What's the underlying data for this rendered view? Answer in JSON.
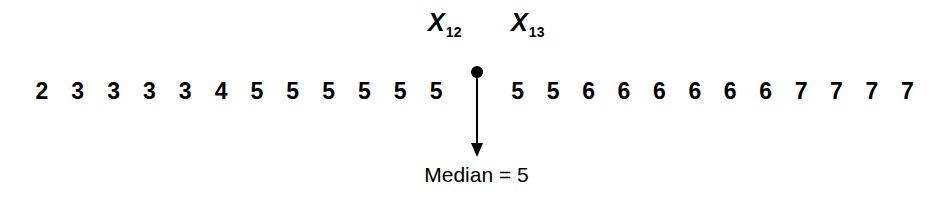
{
  "figure": {
    "background_color": "#ffffff",
    "ink_color": "#000000"
  },
  "labels": {
    "x12": {
      "symbol": "X",
      "subscript": "12",
      "full": "X12"
    },
    "x13": {
      "symbol": "X",
      "subscript": "13",
      "full": "X13"
    }
  },
  "median_pointer": {
    "caption": "Median = 5",
    "marker_name": "median-position-dot"
  },
  "chart_data": {
    "type": "table",
    "title": "",
    "subtitle": "",
    "xlabel": "",
    "ylabel": "",
    "n": 24,
    "ordered_values": [
      2,
      3,
      3,
      3,
      3,
      4,
      5,
      5,
      5,
      5,
      5,
      5,
      5,
      5,
      6,
      6,
      6,
      6,
      6,
      6,
      7,
      7,
      7,
      7
    ],
    "left_group": {
      "label": "values below the median position",
      "count": 12,
      "values": [
        2,
        3,
        3,
        3,
        3,
        4,
        5,
        5,
        5,
        5,
        5,
        5
      ]
    },
    "right_group": {
      "label": "values above the median position",
      "count": 12,
      "values": [
        5,
        5,
        6,
        6,
        6,
        6,
        6,
        6,
        7,
        7,
        7,
        7
      ]
    },
    "annotations": [
      {
        "text": "X12",
        "role": "label for 12th ordered value",
        "position": "left of median marker"
      },
      {
        "text": "X13",
        "role": "label for 13th ordered value",
        "position": "right of median marker"
      },
      {
        "text": "Median = 5",
        "role": "median callout",
        "position": "below arrow"
      }
    ],
    "median": 5,
    "median_index_low": 12,
    "median_index_high": 13,
    "grid": false,
    "legend": false
  }
}
